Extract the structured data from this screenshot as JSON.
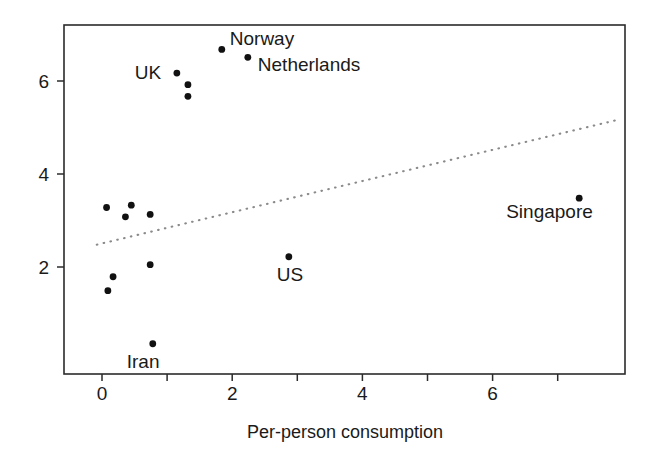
{
  "chart_data": {
    "type": "scatter",
    "title": "",
    "xlabel": "Per-person consumption",
    "ylabel": "",
    "xlim": [
      -0.6,
      8.05
    ],
    "ylim": [
      -0.3,
      7.5
    ],
    "xticks": [
      0,
      1,
      2,
      3,
      4,
      5,
      6,
      7
    ],
    "xticklabels": [
      "0",
      "",
      "2",
      "",
      "4",
      "",
      "6",
      ""
    ],
    "yticks": [
      2,
      4,
      6
    ],
    "yticklabels": [
      "2",
      "4",
      "6"
    ],
    "grid": false,
    "legend": "none",
    "points": [
      {
        "label": "Norway",
        "x": 1.84,
        "y": 6.68,
        "label_dx": 8,
        "label_dy": -4
      },
      {
        "label": "Netherlands",
        "x": 2.24,
        "y": 6.51,
        "label_dx": 10,
        "label_dy": 14
      },
      {
        "label": "UK",
        "x": 1.15,
        "y": 6.17,
        "label_dx": -42,
        "label_dy": 6
      },
      {
        "label": "",
        "x": 1.32,
        "y": 5.92,
        "label_dx": 0,
        "label_dy": 0
      },
      {
        "label": "",
        "x": 1.32,
        "y": 5.67,
        "label_dx": 0,
        "label_dy": 0
      },
      {
        "label": "Singapore",
        "x": 7.33,
        "y": 3.48,
        "label_dx": -73,
        "label_dy": 20
      },
      {
        "label": "",
        "x": 0.07,
        "y": 3.28,
        "label_dx": 0,
        "label_dy": 0
      },
      {
        "label": "",
        "x": 0.45,
        "y": 3.33,
        "label_dx": 0,
        "label_dy": 0
      },
      {
        "label": "",
        "x": 0.36,
        "y": 3.08,
        "label_dx": 0,
        "label_dy": 0
      },
      {
        "label": "",
        "x": 0.74,
        "y": 3.13,
        "label_dx": 0,
        "label_dy": 0
      },
      {
        "label": "US",
        "x": 2.87,
        "y": 2.22,
        "label_dx": -12,
        "label_dy": 24
      },
      {
        "label": "",
        "x": 0.74,
        "y": 2.05,
        "label_dx": 0,
        "label_dy": 0
      },
      {
        "label": "",
        "x": 0.17,
        "y": 1.79,
        "label_dx": 0,
        "label_dy": 0
      },
      {
        "label": "",
        "x": 0.09,
        "y": 1.49,
        "label_dx": 0,
        "label_dy": 0
      },
      {
        "label": "Iran",
        "x": 0.78,
        "y": 0.35,
        "label_dx": -26,
        "label_dy": 24
      }
    ],
    "fit_line": {
      "style": "dotted",
      "color": "#8a8a8a",
      "x_start": -0.08,
      "y_start": 2.48,
      "x_end": 7.88,
      "y_end": 5.15
    },
    "marker": {
      "shape": "circle",
      "color": "#111111",
      "size": 3.4
    }
  },
  "geometry": {
    "plot_left": 64,
    "plot_right": 625,
    "plot_top": 25,
    "plot_bottom": 374,
    "x_zero_px": 102,
    "x_unit_px": 65.1,
    "y_two_px": 267,
    "y_unit_px": 46.5,
    "tick_len": 7,
    "x_label_y": 438,
    "x_ticklabel_y": 400,
    "axis_title_x": 345
  }
}
